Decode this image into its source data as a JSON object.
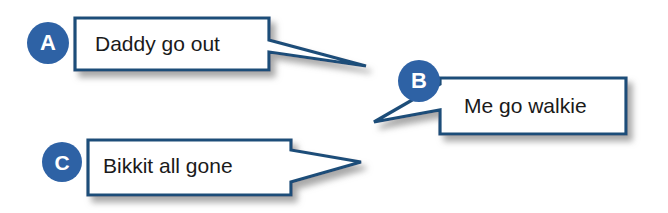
{
  "figure": {
    "kind": "speech-bubble-diagram",
    "background_color": "#ffffff",
    "border_color": "#1f4e79",
    "badge_color": "#2e62a5",
    "badge_text_color": "#ffffff",
    "bubble_fill_color": "#ffffff",
    "text_color": "#1a1a1a",
    "shadow_color": "#b9b9b9"
  },
  "bubbles": [
    {
      "id": "a",
      "label": "A",
      "text": "Daddy go out",
      "tail_direction": "right",
      "box": {
        "x": 75,
        "y": 18,
        "width": 194,
        "height": 52
      },
      "tail_tip": {
        "x": 366,
        "y": 66
      }
    },
    {
      "id": "b",
      "label": "B",
      "text": "Me go walkie",
      "tail_direction": "left-down",
      "box": {
        "x": 440,
        "y": 78,
        "width": 186,
        "height": 56
      },
      "tail_tip": {
        "x": 374,
        "y": 122
      }
    },
    {
      "id": "c",
      "label": "C",
      "text": "Bikkit all gone",
      "tail_direction": "right",
      "box": {
        "x": 88,
        "y": 140,
        "width": 203,
        "height": 55
      },
      "tail_tip": {
        "x": 361,
        "y": 162
      }
    }
  ]
}
